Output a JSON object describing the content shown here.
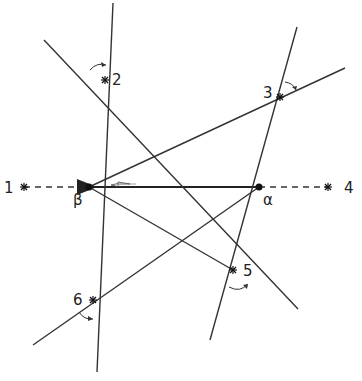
{
  "diagram": {
    "points": {
      "beta": {
        "label": "β",
        "x": 89,
        "y": 187
      },
      "alpha": {
        "label": "α",
        "x": 259,
        "y": 187
      },
      "p1": {
        "label": "1",
        "x": 24,
        "y": 187
      },
      "p2": {
        "label": "2",
        "x": 105,
        "y": 80
      },
      "p3": {
        "label": "3",
        "x": 280,
        "y": 97
      },
      "p4": {
        "label": "4",
        "x": 328,
        "y": 187
      },
      "p5": {
        "label": "5",
        "x": 233,
        "y": 270
      },
      "p6": {
        "label": "6",
        "x": 93,
        "y": 300
      }
    },
    "labels": {
      "l1": "1",
      "l2": "2",
      "l3": "3",
      "l4": "4",
      "l5": "5",
      "l6": "6",
      "beta": "β",
      "alpha": "α"
    },
    "colors": {
      "line": "#333333",
      "background": "#ffffff"
    }
  }
}
